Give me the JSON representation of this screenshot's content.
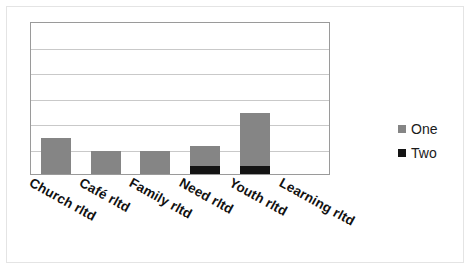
{
  "chart_data": {
    "type": "bar",
    "subtype": "stacked-column",
    "title": "",
    "xlabel": "",
    "ylabel": "",
    "categories": [
      "Church rltd",
      "Café rltd",
      "Family rltd",
      "Need rltd",
      "Youth rltd",
      "Learning rltd"
    ],
    "series": [
      {
        "name": "One",
        "color": "#858585",
        "values": [
          1.4,
          0.9,
          0.9,
          0.8,
          2.1,
          0
        ]
      },
      {
        "name": "Two",
        "color": "#141414",
        "values": [
          0,
          0,
          0,
          0.3,
          0.3,
          0
        ]
      }
    ],
    "ylim": [
      0,
      6
    ],
    "yticks": [
      0,
      1,
      2,
      3,
      4,
      5,
      6
    ],
    "ytick_labels_visible": false,
    "grid": true,
    "gridline_count": 5,
    "legend_position": "right",
    "plot_border": true,
    "axis_label_rotation_deg": 29
  },
  "legend": {
    "items": [
      {
        "label": "One",
        "swatch_color": "#858585"
      },
      {
        "label": "Two",
        "swatch_color": "#141414"
      }
    ]
  },
  "axis": {
    "categories": [
      {
        "label": "Church rltd"
      },
      {
        "label": "Café rltd"
      },
      {
        "label": "Family rltd"
      },
      {
        "label": "Need rltd"
      },
      {
        "label": "Youth rltd"
      },
      {
        "label": "Learning rltd"
      }
    ]
  },
  "colors": {
    "series_one": "#858585",
    "series_two": "#141414",
    "gridline": "#c9c9c9",
    "plot_border": "#9a9a9a",
    "outer_frame": "#e4e4e4",
    "background": "#ffffff",
    "text": "#111111"
  }
}
